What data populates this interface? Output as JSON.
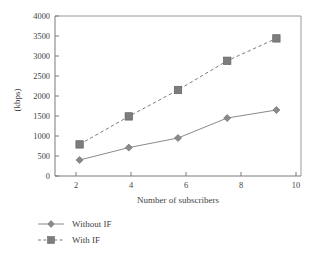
{
  "chart_data": {
    "type": "line",
    "title": "",
    "xlabel": "Number of subscribers",
    "ylabel": "(kbps)",
    "x": [
      2,
      4,
      6,
      8,
      10
    ],
    "xticklabels": [
      "2",
      "4",
      "6",
      "8",
      "10"
    ],
    "yticklabels": [
      "0",
      "500",
      "1000",
      "1500",
      "2000",
      "2500",
      "3000",
      "3500",
      "4000"
    ],
    "yticks": [
      0,
      500,
      1000,
      1500,
      2000,
      2500,
      3000,
      3500,
      4000
    ],
    "xlim": [
      1,
      11
    ],
    "ylim": [
      0,
      4000
    ],
    "grid": false,
    "legend_position": "bottom-left",
    "series": [
      {
        "name": "Without IF",
        "values": [
          400,
          710,
          950,
          1450,
          1650
        ],
        "color": "#8a8a8a",
        "marker": "diamond",
        "linestyle": "solid"
      },
      {
        "name": "With IF",
        "values": [
          790,
          1490,
          2150,
          2880,
          3440
        ],
        "color": "#7d7d7d",
        "marker": "square",
        "linestyle": "dashed"
      }
    ]
  },
  "axes": {
    "y_label": "(kbps)",
    "x_label": "Number of subscribers",
    "y_tick_0": "0",
    "y_tick_1": "500",
    "y_tick_2": "1000",
    "y_tick_3": "1500",
    "y_tick_4": "2000",
    "y_tick_5": "2500",
    "y_tick_6": "3000",
    "y_tick_7": "3500",
    "y_tick_8": "4000",
    "x_tick_0": "2",
    "x_tick_1": "4",
    "x_tick_2": "6",
    "x_tick_3": "8",
    "x_tick_4": "10"
  },
  "legend": {
    "item_0": "Without IF",
    "item_1": "With IF"
  },
  "colors": {
    "series_without_if": "#8a8a8a",
    "series_with_if": "#7d7d7d",
    "axis": "#7b7b7b",
    "frame": "#9a9a9a",
    "text": "#3f3f3f",
    "background": "#ffffff"
  }
}
